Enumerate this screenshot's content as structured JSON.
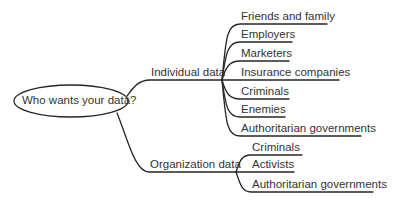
{
  "colors": {
    "line": "#262626",
    "text": "#333333",
    "background": "#ffffff"
  },
  "root": {
    "label": "Who wants your data?"
  },
  "branches": [
    {
      "label": "Individual data",
      "children": [
        "Friends and family",
        "Employers",
        "Marketers",
        "Insurance companies",
        "Criminals",
        "Enemies",
        "Authoritarian governments"
      ]
    },
    {
      "label": "Organization data",
      "children": [
        "Criminals",
        "Activists",
        "Authoritarian governments"
      ]
    }
  ]
}
